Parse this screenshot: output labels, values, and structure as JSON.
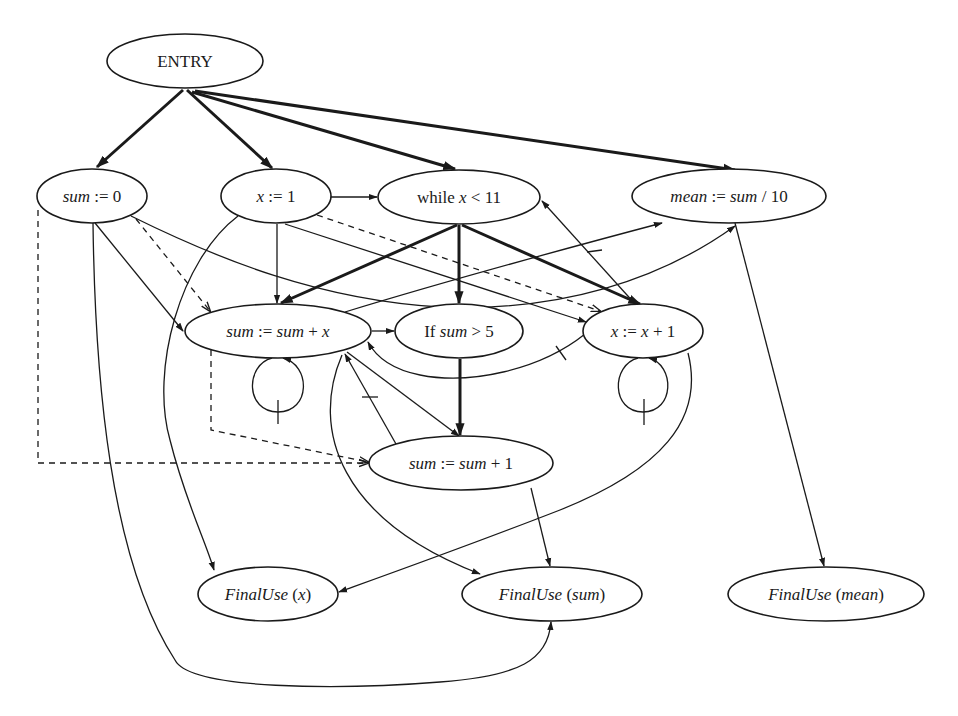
{
  "diagram": {
    "nodes": [
      {
        "id": "entry",
        "label": "ENTRY",
        "cx": 185,
        "cy": 61,
        "rx": 78,
        "ry": 27,
        "style": "roman"
      },
      {
        "id": "sum0",
        "label_parts": [
          {
            "t": "sum",
            "i": true
          },
          {
            "t": " := 0",
            "i": false
          }
        ],
        "label": "sum := 0",
        "cx": 92,
        "cy": 196,
        "rx": 55,
        "ry": 27
      },
      {
        "id": "x1",
        "label_parts": [
          {
            "t": "x",
            "i": true
          },
          {
            "t": " := 1",
            "i": false
          }
        ],
        "label": "x := 1",
        "cx": 276,
        "cy": 196,
        "rx": 55,
        "ry": 27
      },
      {
        "id": "while",
        "label_parts": [
          {
            "t": "while ",
            "i": false
          },
          {
            "t": "x",
            "i": true
          },
          {
            "t": " < 11",
            "i": false
          }
        ],
        "label": "while x < 11",
        "cx": 459,
        "cy": 197,
        "rx": 81,
        "ry": 27
      },
      {
        "id": "mean",
        "label_parts": [
          {
            "t": "mean",
            "i": true
          },
          {
            "t": " := ",
            "i": false
          },
          {
            "t": "sum",
            "i": true
          },
          {
            "t": " / 10",
            "i": false
          }
        ],
        "label": "mean := sum / 10",
        "cx": 729,
        "cy": 196,
        "rx": 97,
        "ry": 27
      },
      {
        "id": "sumx",
        "label_parts": [
          {
            "t": "sum",
            "i": true
          },
          {
            "t": " := ",
            "i": false
          },
          {
            "t": "sum",
            "i": true
          },
          {
            "t": " + ",
            "i": false
          },
          {
            "t": "x",
            "i": true
          }
        ],
        "label": "sum := sum + x",
        "cx": 278,
        "cy": 331,
        "rx": 93,
        "ry": 27
      },
      {
        "id": "if",
        "label_parts": [
          {
            "t": "If ",
            "i": false
          },
          {
            "t": "sum",
            "i": true
          },
          {
            "t": " > 5",
            "i": false
          }
        ],
        "label": "If sum > 5",
        "cx": 459,
        "cy": 331,
        "rx": 64,
        "ry": 27
      },
      {
        "id": "xinc",
        "label_parts": [
          {
            "t": "x",
            "i": true
          },
          {
            "t": " := ",
            "i": false
          },
          {
            "t": "x",
            "i": true
          },
          {
            "t": " + 1",
            "i": false
          }
        ],
        "label": "x := x + 1",
        "cx": 643,
        "cy": 331,
        "rx": 60,
        "ry": 27
      },
      {
        "id": "sum1",
        "label_parts": [
          {
            "t": "sum",
            "i": true
          },
          {
            "t": " := ",
            "i": false
          },
          {
            "t": "sum",
            "i": true
          },
          {
            "t": " + 1",
            "i": false
          }
        ],
        "label": "sum := sum + 1",
        "cx": 461,
        "cy": 463,
        "rx": 92,
        "ry": 27
      },
      {
        "id": "fux",
        "label_parts": [
          {
            "t": "FinalUse",
            "i": true
          },
          {
            "t": " (",
            "i": false
          },
          {
            "t": "x",
            "i": true
          },
          {
            "t": ")",
            "i": false
          }
        ],
        "label": "FinalUse (x)",
        "cx": 268,
        "cy": 594,
        "rx": 70,
        "ry": 27
      },
      {
        "id": "fusum",
        "label_parts": [
          {
            "t": "FinalUse",
            "i": true
          },
          {
            "t": " (",
            "i": false
          },
          {
            "t": "sum",
            "i": true
          },
          {
            "t": ")",
            "i": false
          }
        ],
        "label": "FinalUse (sum)",
        "cx": 552,
        "cy": 594,
        "rx": 90,
        "ry": 27
      },
      {
        "id": "fumean",
        "label_parts": [
          {
            "t": "FinalUse",
            "i": true
          },
          {
            "t": " (",
            "i": false
          },
          {
            "t": "mean",
            "i": true
          },
          {
            "t": ")",
            "i": false
          }
        ],
        "label": "FinalUse (mean)",
        "cx": 826,
        "cy": 594,
        "rx": 98,
        "ry": 27
      }
    ],
    "edge_kinds": {
      "control": "bold solid",
      "flow": "thin solid",
      "def_order": "dashed"
    },
    "edges": [
      {
        "from": "entry",
        "to": "sum0",
        "kind": "control"
      },
      {
        "from": "entry",
        "to": "x1",
        "kind": "control"
      },
      {
        "from": "entry",
        "to": "while",
        "kind": "control"
      },
      {
        "from": "entry",
        "to": "mean",
        "kind": "control"
      },
      {
        "from": "while",
        "to": "sumx",
        "kind": "control"
      },
      {
        "from": "while",
        "to": "if",
        "kind": "control"
      },
      {
        "from": "while",
        "to": "xinc",
        "kind": "control"
      },
      {
        "from": "if",
        "to": "sum1",
        "kind": "control"
      },
      {
        "from": "x1",
        "to": "while",
        "kind": "flow"
      },
      {
        "from": "x1",
        "to": "sumx",
        "kind": "flow"
      },
      {
        "from": "x1",
        "to": "xinc",
        "kind": "flow"
      },
      {
        "from": "x1",
        "to": "fux",
        "kind": "flow"
      },
      {
        "from": "sum0",
        "to": "sumx",
        "kind": "flow"
      },
      {
        "from": "sum0",
        "to": "mean",
        "kind": "flow"
      },
      {
        "from": "sum0",
        "to": "fusum",
        "kind": "flow"
      },
      {
        "from": "sumx",
        "to": "if",
        "kind": "flow"
      },
      {
        "from": "sumx",
        "to": "sumx",
        "kind": "flow",
        "loop_carried": true
      },
      {
        "from": "sumx",
        "to": "sum1",
        "kind": "flow"
      },
      {
        "from": "sumx",
        "to": "mean",
        "kind": "flow"
      },
      {
        "from": "sumx",
        "to": "fusum",
        "kind": "flow"
      },
      {
        "from": "sum1",
        "to": "sumx",
        "kind": "flow",
        "loop_carried": true
      },
      {
        "from": "sum1",
        "to": "fusum",
        "kind": "flow"
      },
      {
        "from": "xinc",
        "to": "while",
        "kind": "flow",
        "loop_carried": true
      },
      {
        "from": "xinc",
        "to": "sumx",
        "kind": "flow",
        "loop_carried": true
      },
      {
        "from": "xinc",
        "to": "xinc",
        "kind": "flow",
        "loop_carried": true
      },
      {
        "from": "xinc",
        "to": "fux",
        "kind": "flow"
      },
      {
        "from": "mean",
        "to": "fumean",
        "kind": "flow"
      },
      {
        "from": "sum0",
        "to": "sumx",
        "kind": "def_order"
      },
      {
        "from": "sum0",
        "to": "sum1",
        "kind": "def_order"
      },
      {
        "from": "x1",
        "to": "xinc",
        "kind": "def_order"
      },
      {
        "from": "sumx",
        "to": "sum1",
        "kind": "def_order"
      }
    ]
  }
}
